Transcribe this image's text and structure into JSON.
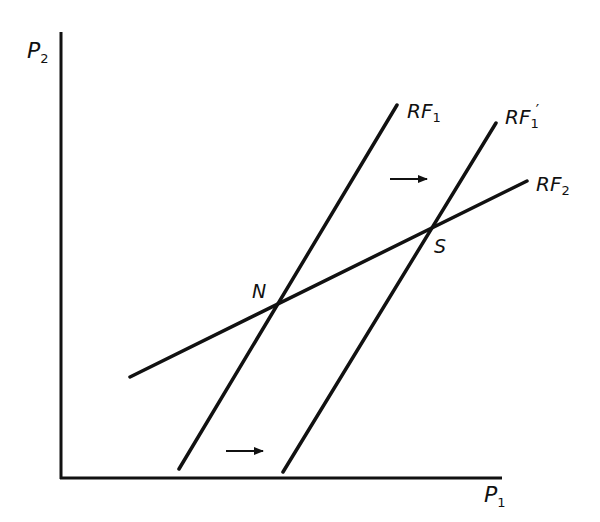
{
  "diagram": {
    "type": "reaction-function diagram",
    "axes": {
      "y_label": {
        "main": "P",
        "sub": "2"
      },
      "x_label": {
        "main": "P",
        "sub": "1"
      }
    },
    "lines": [
      {
        "id": "RF1",
        "label": {
          "main": "RF",
          "sub": "1",
          "prime": ""
        },
        "from": [
          179,
          469
        ],
        "to": [
          397,
          105
        ]
      },
      {
        "id": "RF1prime",
        "label": {
          "main": "RF",
          "sub": "1",
          "prime": "′"
        },
        "from": [
          283,
          472
        ],
        "to": [
          496,
          123
        ]
      },
      {
        "id": "RF2",
        "label": {
          "main": "RF",
          "sub": "2",
          "prime": ""
        },
        "from": [
          130,
          377
        ],
        "to": [
          527,
          181
        ]
      }
    ],
    "points": [
      {
        "id": "N",
        "label": "N",
        "x": 275,
        "y": 305
      },
      {
        "id": "S",
        "label": "S",
        "x": 428,
        "y": 232
      }
    ],
    "arrows": [
      {
        "id": "shift-arrow-upper",
        "from": [
          390,
          179
        ],
        "to": [
          427,
          179
        ],
        "direction": "right"
      },
      {
        "id": "shift-arrow-lower",
        "from": [
          226,
          451
        ],
        "to": [
          263,
          451
        ],
        "direction": "right"
      }
    ],
    "colors": {
      "ink": "#111111",
      "background": "#ffffff"
    }
  }
}
